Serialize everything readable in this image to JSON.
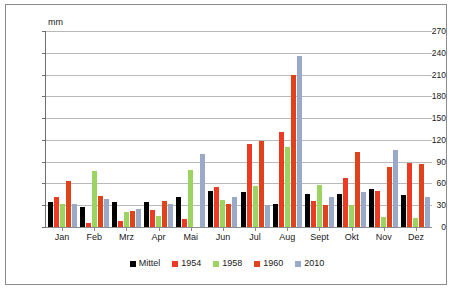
{
  "unit_label": "mm",
  "colors": {
    "mittel": "#000000",
    "y1954": "#ec3a23",
    "y1958": "#9bd461",
    "y1960": "#e0431b",
    "y2010": "#9aa9c8",
    "gridline": "#b9b9b9",
    "axis": "#6f6f6f",
    "border": "#8c8c8c",
    "background": "#ffffff"
  },
  "legend": {
    "items": [
      {
        "label": "Mittel",
        "color": "#000000"
      },
      {
        "label": "1954",
        "color": "#ec3a23"
      },
      {
        "label": "1958",
        "color": "#9bd461"
      },
      {
        "label": "1960",
        "color": "#e0431b"
      },
      {
        "label": "2010",
        "color": "#9aa9c8"
      }
    ]
  },
  "yticks": [
    270,
    240,
    210,
    180,
    150,
    120,
    90,
    60,
    30,
    0
  ],
  "chart_data": {
    "type": "bar",
    "title": "",
    "subtitle": "",
    "xlabel": "",
    "ylabel": "mm",
    "ylim": [
      0,
      270
    ],
    "ytick_step": 30,
    "grid": true,
    "legend_position": "bottom",
    "categories": [
      "Jan",
      "Feb",
      "Mrz",
      "Apr",
      "Mai",
      "Jun",
      "Jul",
      "Aug",
      "Sept",
      "Okt",
      "Nov",
      "Dez"
    ],
    "series": [
      {
        "name": "Mittel",
        "color": "#000000",
        "values": [
          35,
          27,
          34,
          35,
          42,
          50,
          48,
          32,
          46,
          45,
          52,
          44
        ]
      },
      {
        "name": "1954",
        "color": "#ec3a23",
        "values": [
          41,
          5,
          8,
          23,
          11,
          55,
          114,
          131,
          36,
          68,
          49,
          88
        ]
      },
      {
        "name": "1958",
        "color": "#9bd461",
        "values": [
          32,
          77,
          20,
          15,
          78,
          37,
          56,
          110,
          58,
          31,
          14,
          12
        ]
      },
      {
        "name": "1960",
        "color": "#e0431b",
        "values": [
          64,
          43,
          22,
          36,
          0,
          32,
          118,
          209,
          31,
          103,
          83,
          87
        ]
      },
      {
        "name": "2010",
        "color": "#9aa9c8",
        "values": [
          32,
          38,
          25,
          32,
          100,
          41,
          30,
          236,
          42,
          48,
          106,
          42
        ]
      }
    ]
  }
}
